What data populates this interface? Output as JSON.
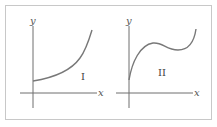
{
  "figure": {
    "panels": [
      {
        "id": "I",
        "label": "I",
        "x_axis_label": "x",
        "y_axis_label": "y",
        "curve_description": "increasing, concave up, positive y-intercept"
      },
      {
        "id": "II",
        "label": "II",
        "x_axis_label": "x",
        "y_axis_label": "y",
        "curve_description": "rises steeply from positive y-intercept, local max, local min, then rises"
      }
    ],
    "colors": {
      "frame": "#c8c8c8",
      "axis": "#6e6e6e",
      "curve": "#787878",
      "text": "#555555"
    }
  }
}
